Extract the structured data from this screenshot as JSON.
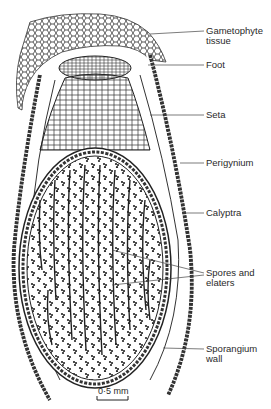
{
  "figure": {
    "labels": [
      {
        "id": "gametophyte-tissue",
        "text": "Gametophyte\ntissue",
        "x": 206,
        "y": 27,
        "line_from": [
          150,
          34
        ]
      },
      {
        "id": "foot",
        "text": "Foot",
        "x": 206,
        "y": 61,
        "line_from": [
          148,
          65
        ]
      },
      {
        "id": "seta",
        "text": "Seta",
        "x": 206,
        "y": 111,
        "line_from": [
          150,
          115
        ]
      },
      {
        "id": "perigynium",
        "text": "Perigynium",
        "x": 206,
        "y": 159,
        "line_from": [
          180,
          163
        ]
      },
      {
        "id": "calyptra",
        "text": "Calyptra",
        "x": 206,
        "y": 208,
        "line_from": [
          182,
          213
        ]
      },
      {
        "id": "spores-and-elaters",
        "text": "Spores and\nelaters",
        "x": 206,
        "y": 269,
        "line_from": [
          112,
          250
        ]
      },
      {
        "id": "sporangium-wall",
        "text": "Sporangium\nwall",
        "x": 206,
        "y": 345,
        "line_from": [
          163,
          348
        ]
      }
    ],
    "scale_bar": {
      "label": "0·5 mm",
      "x1": 97,
      "x2": 128,
      "y": 398
    }
  }
}
